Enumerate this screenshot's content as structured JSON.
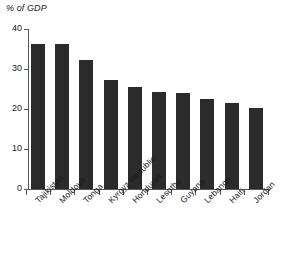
{
  "chart_data": {
    "type": "bar",
    "title": "% of GDP",
    "subtitle": "",
    "xlabel": "",
    "ylabel": "",
    "ylim": [
      0,
      40
    ],
    "yticks": [
      0,
      10,
      20,
      30,
      40
    ],
    "grid": false,
    "legend": null,
    "bar_color": "#2b2b2b",
    "axis_color": "#575757",
    "categories": [
      "Tajikistan",
      "Moldova",
      "Tonga",
      "Kyrgyz Republic",
      "Honduras",
      "Lesotho",
      "Guyana",
      "Lebanon",
      "Haiti",
      "Jordan"
    ],
    "values": [
      36.2,
      36.2,
      32.3,
      27.3,
      25.5,
      24.3,
      24.1,
      22.6,
      21.5,
      20.2
    ]
  },
  "axis": {
    "title": "% of GDP",
    "tick_0": "0",
    "tick_10": "10",
    "tick_20": "20",
    "tick_30": "30",
    "tick_40": "40"
  },
  "bars": [
    {
      "label": "Tajikistan",
      "value": 36.2
    },
    {
      "label": "Moldova",
      "value": 36.2
    },
    {
      "label": "Tonga",
      "value": 32.3
    },
    {
      "label": "Kyrgyz Republic",
      "value": 27.3
    },
    {
      "label": "Honduras",
      "value": 25.5
    },
    {
      "label": "Lesotho",
      "value": 24.3
    },
    {
      "label": "Guyana",
      "value": 24.1
    },
    {
      "label": "Lebanon",
      "value": 22.6
    },
    {
      "label": "Haiti",
      "value": 21.5
    },
    {
      "label": "Jordan",
      "value": 20.2
    }
  ]
}
